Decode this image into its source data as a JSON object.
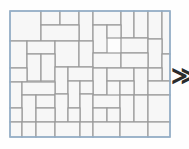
{
  "figure": {
    "frame": {
      "stroke_color": "#8fb0cf",
      "stroke_width": 1.4,
      "fill_color": "#fdfdfd",
      "x": 1,
      "y": 1,
      "width": 160,
      "height": 126
    },
    "tile": {
      "fill_color": "#f7f7f7",
      "stroke_color": "#9a9a9a",
      "stroke_width": 1.2
    },
    "units": "px",
    "tile_count": 58,
    "tiles": [
      {
        "id": "t01",
        "x": 1,
        "y": 1,
        "w": 31,
        "h": 30
      },
      {
        "id": "t02",
        "x": 32,
        "y": 1,
        "w": 19,
        "h": 14
      },
      {
        "id": "t03",
        "x": 51,
        "y": 1,
        "w": 19,
        "h": 14
      },
      {
        "id": "t04",
        "x": 70,
        "y": 1,
        "w": 14,
        "h": 30
      },
      {
        "id": "t05",
        "x": 84,
        "y": 1,
        "w": 28,
        "h": 14
      },
      {
        "id": "t06",
        "x": 112,
        "y": 1,
        "w": 13,
        "h": 27
      },
      {
        "id": "t07",
        "x": 125,
        "y": 1,
        "w": 14,
        "h": 27
      },
      {
        "id": "t08",
        "x": 139,
        "y": 1,
        "w": 14,
        "h": 28
      },
      {
        "id": "t09",
        "x": 153,
        "y": 1,
        "w": 8,
        "h": 43
      },
      {
        "id": "t10",
        "x": 32,
        "y": 15,
        "w": 38,
        "h": 16
      },
      {
        "id": "t11",
        "x": 84,
        "y": 15,
        "w": 14,
        "h": 28
      },
      {
        "id": "t12",
        "x": 98,
        "y": 15,
        "w": 14,
        "h": 13
      },
      {
        "id": "t13",
        "x": 112,
        "y": 28,
        "w": 27,
        "h": 15
      },
      {
        "id": "t14",
        "x": 139,
        "y": 29,
        "w": 14,
        "h": 29
      },
      {
        "id": "t15",
        "x": 1,
        "y": 31,
        "w": 17,
        "h": 27
      },
      {
        "id": "t16",
        "x": 18,
        "y": 31,
        "w": 28,
        "h": 13
      },
      {
        "id": "t17",
        "x": 46,
        "y": 31,
        "w": 24,
        "h": 26
      },
      {
        "id": "t18",
        "x": 70,
        "y": 31,
        "w": 14,
        "h": 26
      },
      {
        "id": "t19",
        "x": 18,
        "y": 44,
        "w": 14,
        "h": 27
      },
      {
        "id": "t20",
        "x": 32,
        "y": 44,
        "w": 14,
        "h": 27
      },
      {
        "id": "t21",
        "x": 84,
        "y": 43,
        "w": 28,
        "h": 15
      },
      {
        "id": "t22",
        "x": 112,
        "y": 43,
        "w": 27,
        "h": 15
      },
      {
        "id": "t23",
        "x": 153,
        "y": 44,
        "w": 8,
        "h": 27
      },
      {
        "id": "t24",
        "x": 46,
        "y": 57,
        "w": 13,
        "h": 27
      },
      {
        "id": "t25",
        "x": 59,
        "y": 57,
        "w": 25,
        "h": 14
      },
      {
        "id": "t26",
        "x": 1,
        "y": 58,
        "w": 17,
        "h": 14
      },
      {
        "id": "t27",
        "x": 84,
        "y": 58,
        "w": 14,
        "h": 27
      },
      {
        "id": "t28",
        "x": 98,
        "y": 58,
        "w": 27,
        "h": 13
      },
      {
        "id": "t29",
        "x": 125,
        "y": 58,
        "w": 14,
        "h": 27
      },
      {
        "id": "t30",
        "x": 139,
        "y": 58,
        "w": 14,
        "h": 13
      },
      {
        "id": "t31",
        "x": 59,
        "y": 71,
        "w": 12,
        "h": 27
      },
      {
        "id": "t32",
        "x": 71,
        "y": 71,
        "w": 13,
        "h": 13
      },
      {
        "id": "t33",
        "x": 98,
        "y": 71,
        "w": 13,
        "h": 27
      },
      {
        "id": "t34",
        "x": 111,
        "y": 71,
        "w": 14,
        "h": 14
      },
      {
        "id": "t35",
        "x": 139,
        "y": 71,
        "w": 22,
        "h": 14
      },
      {
        "id": "t36",
        "x": 1,
        "y": 72,
        "w": 12,
        "h": 26
      },
      {
        "id": "t37",
        "x": 13,
        "y": 72,
        "w": 33,
        "h": 13
      },
      {
        "id": "t38",
        "x": 13,
        "y": 85,
        "w": 14,
        "h": 27
      },
      {
        "id": "t39",
        "x": 27,
        "y": 85,
        "w": 19,
        "h": 13
      },
      {
        "id": "t40",
        "x": 46,
        "y": 84,
        "w": 13,
        "h": 28
      },
      {
        "id": "t41",
        "x": 71,
        "y": 84,
        "w": 13,
        "h": 28
      },
      {
        "id": "t42",
        "x": 84,
        "y": 85,
        "w": 27,
        "h": 13
      },
      {
        "id": "t43",
        "x": 111,
        "y": 85,
        "w": 14,
        "h": 27
      },
      {
        "id": "t44",
        "x": 125,
        "y": 85,
        "w": 14,
        "h": 27
      },
      {
        "id": "t45",
        "x": 139,
        "y": 85,
        "w": 22,
        "h": 27
      },
      {
        "id": "t46",
        "x": 1,
        "y": 98,
        "w": 12,
        "h": 14
      },
      {
        "id": "t47",
        "x": 27,
        "y": 98,
        "w": 19,
        "h": 14
      },
      {
        "id": "t48",
        "x": 59,
        "y": 98,
        "w": 12,
        "h": 14
      },
      {
        "id": "t49",
        "x": 84,
        "y": 98,
        "w": 14,
        "h": 14
      },
      {
        "id": "t50",
        "x": 98,
        "y": 98,
        "w": 13,
        "h": 14
      },
      {
        "id": "t51",
        "x": 1,
        "y": 112,
        "w": 12,
        "h": 15
      },
      {
        "id": "t52",
        "x": 13,
        "y": 112,
        "w": 14,
        "h": 15
      },
      {
        "id": "t53",
        "x": 27,
        "y": 112,
        "w": 19,
        "h": 15
      },
      {
        "id": "t54",
        "x": 46,
        "y": 112,
        "w": 25,
        "h": 15
      },
      {
        "id": "t55",
        "x": 71,
        "y": 112,
        "w": 13,
        "h": 15
      },
      {
        "id": "t56",
        "x": 84,
        "y": 112,
        "w": 27,
        "h": 15
      },
      {
        "id": "t57",
        "x": 111,
        "y": 112,
        "w": 28,
        "h": 15
      },
      {
        "id": "t58",
        "x": 139,
        "y": 112,
        "w": 22,
        "h": 15
      }
    ]
  },
  "chevron": {
    "glyph": "≫",
    "label": "continuation-chevron"
  }
}
